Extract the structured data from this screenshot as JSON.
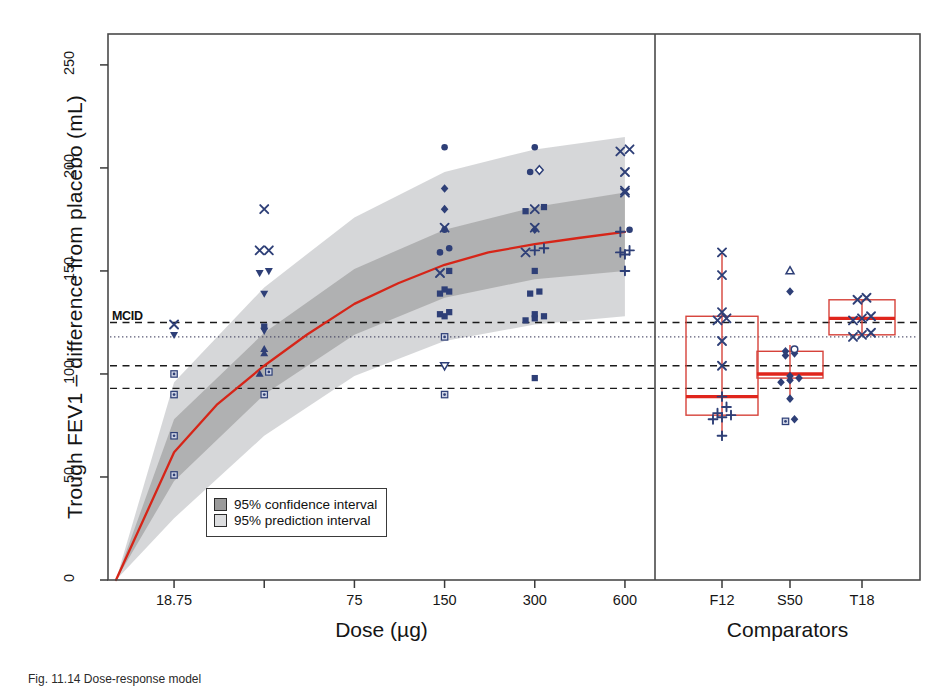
{
  "figure": {
    "domain": "chart",
    "background": "#ffffff",
    "caption_fragment": "Fig. 11.14  Dose-response model"
  },
  "chart_data": {
    "type": "scatter",
    "title": "",
    "subtitle": "",
    "xlabel": "Dose (µg)",
    "ylabel": "Trough FEV1 – difference from placebo (mL)",
    "ylim": [
      0,
      265
    ],
    "yticks": [
      0,
      50,
      100,
      150,
      200,
      250
    ],
    "ytick_labels": [
      "0",
      "50",
      "100",
      "150",
      "200",
      "250"
    ],
    "grid": false,
    "panels": [
      {
        "name": "dose-response",
        "xlabel": "Dose (µg)",
        "xscale": "log",
        "xticks": [
          18.75,
          37.5,
          75,
          150,
          300,
          600
        ],
        "xtick_labels": [
          "18.75",
          "",
          "75",
          "150",
          "300",
          "600"
        ],
        "model_curve": {
          "name": "Emax dose-response fit",
          "color": "#d62518",
          "points": [
            {
              "dose": 12.0,
              "value": 0
            },
            {
              "dose": 18.75,
              "value": 62
            },
            {
              "dose": 26.0,
              "value": 85
            },
            {
              "dose": 37.5,
              "value": 104
            },
            {
              "dose": 52.0,
              "value": 119
            },
            {
              "dose": 75.0,
              "value": 134
            },
            {
              "dose": 105.0,
              "value": 144
            },
            {
              "dose": 150.0,
              "value": 153
            },
            {
              "dose": 210.0,
              "value": 159
            },
            {
              "dose": 300.0,
              "value": 163
            },
            {
              "dose": 420.0,
              "value": 166
            },
            {
              "dose": 600.0,
              "value": 169
            }
          ]
        },
        "confidence_interval": {
          "label": "95% confidence interval",
          "color": "#9a9a9a",
          "level": 0.95,
          "lower": [
            {
              "dose": 12.0,
              "value": 0
            },
            {
              "dose": 18.75,
              "value": 48
            },
            {
              "dose": 37.5,
              "value": 90
            },
            {
              "dose": 75.0,
              "value": 119
            },
            {
              "dose": 150.0,
              "value": 137
            },
            {
              "dose": 300.0,
              "value": 146
            },
            {
              "dose": 600.0,
              "value": 150
            }
          ],
          "upper": [
            {
              "dose": 12.0,
              "value": 0
            },
            {
              "dose": 18.75,
              "value": 78
            },
            {
              "dose": 37.5,
              "value": 120
            },
            {
              "dose": 75.0,
              "value": 151
            },
            {
              "dose": 150.0,
              "value": 170
            },
            {
              "dose": 300.0,
              "value": 181
            },
            {
              "dose": 600.0,
              "value": 188
            }
          ]
        },
        "prediction_interval": {
          "label": "95% prediction interval",
          "color": "#c6c8ca",
          "level": 0.95,
          "lower": [
            {
              "dose": 12.0,
              "value": 0
            },
            {
              "dose": 18.75,
              "value": 30
            },
            {
              "dose": 37.5,
              "value": 70
            },
            {
              "dose": 75.0,
              "value": 99
            },
            {
              "dose": 150.0,
              "value": 116
            },
            {
              "dose": 300.0,
              "value": 124
            },
            {
              "dose": 600.0,
              "value": 128
            }
          ],
          "upper": [
            {
              "dose": 12.0,
              "value": 0
            },
            {
              "dose": 18.75,
              "value": 96
            },
            {
              "dose": 37.5,
              "value": 142
            },
            {
              "dose": 75.0,
              "value": 176
            },
            {
              "dose": 150.0,
              "value": 198
            },
            {
              "dose": 300.0,
              "value": 209
            },
            {
              "dose": 600.0,
              "value": 215
            }
          ]
        },
        "reference_lines": [
          {
            "name": "MCID",
            "value": 125,
            "style": "dashed",
            "label": "MCID",
            "color": "#1a1a1a"
          },
          {
            "name": "secondary-dotted",
            "value": 118,
            "style": "dotted",
            "label": "",
            "color": "#3b3b5c"
          },
          {
            "name": "mid-dashed",
            "value": 104,
            "style": "dashed",
            "label": "",
            "color": "#1a1a1a"
          },
          {
            "name": "lower-dashed",
            "value": 93,
            "style": "dashed",
            "label": "",
            "color": "#1a1a1a"
          }
        ],
        "points": [
          {
            "dose": 18.75,
            "value": 51,
            "marker": "square-dot"
          },
          {
            "dose": 18.75,
            "value": 70,
            "marker": "square-dot"
          },
          {
            "dose": 18.75,
            "value": 90,
            "marker": "square-dot"
          },
          {
            "dose": 18.75,
            "value": 100,
            "marker": "square-dot"
          },
          {
            "dose": 18.75,
            "value": 119,
            "marker": "triangle-down"
          },
          {
            "dose": 18.75,
            "value": 124,
            "marker": "x"
          },
          {
            "dose": 37.5,
            "value": 90,
            "marker": "square-dot"
          },
          {
            "dose": 37.5,
            "value": 100,
            "marker": "triangle-up"
          },
          {
            "dose": 37.5,
            "value": 101,
            "marker": "square-dot"
          },
          {
            "dose": 37.5,
            "value": 110,
            "marker": "triangle-up"
          },
          {
            "dose": 37.5,
            "value": 112,
            "marker": "triangle-up"
          },
          {
            "dose": 37.5,
            "value": 121,
            "marker": "triangle-down"
          },
          {
            "dose": 37.5,
            "value": 123,
            "marker": "square"
          },
          {
            "dose": 37.5,
            "value": 139,
            "marker": "triangle-down"
          },
          {
            "dose": 37.5,
            "value": 149,
            "marker": "triangle-down"
          },
          {
            "dose": 37.5,
            "value": 150,
            "marker": "triangle-down"
          },
          {
            "dose": 37.5,
            "value": 160,
            "marker": "x"
          },
          {
            "dose": 37.5,
            "value": 160,
            "marker": "x"
          },
          {
            "dose": 37.5,
            "value": 180,
            "marker": "x"
          },
          {
            "dose": 150,
            "value": 90,
            "marker": "square-dot"
          },
          {
            "dose": 150,
            "value": 104,
            "marker": "triangle-down-open"
          },
          {
            "dose": 150,
            "value": 118,
            "marker": "square-dot"
          },
          {
            "dose": 150,
            "value": 128,
            "marker": "square"
          },
          {
            "dose": 150,
            "value": 129,
            "marker": "square"
          },
          {
            "dose": 150,
            "value": 130,
            "marker": "square"
          },
          {
            "dose": 150,
            "value": 139,
            "marker": "square"
          },
          {
            "dose": 150,
            "value": 140,
            "marker": "square"
          },
          {
            "dose": 150,
            "value": 141,
            "marker": "square"
          },
          {
            "dose": 150,
            "value": 149,
            "marker": "x"
          },
          {
            "dose": 150,
            "value": 150,
            "marker": "square"
          },
          {
            "dose": 150,
            "value": 159,
            "marker": "circle"
          },
          {
            "dose": 150,
            "value": 161,
            "marker": "circle"
          },
          {
            "dose": 150,
            "value": 170,
            "marker": "circle"
          },
          {
            "dose": 150,
            "value": 171,
            "marker": "x"
          },
          {
            "dose": 150,
            "value": 180,
            "marker": "diamond"
          },
          {
            "dose": 150,
            "value": 190,
            "marker": "diamond"
          },
          {
            "dose": 150,
            "value": 210,
            "marker": "circle"
          },
          {
            "dose": 300,
            "value": 98,
            "marker": "square"
          },
          {
            "dose": 300,
            "value": 126,
            "marker": "square"
          },
          {
            "dose": 300,
            "value": 127,
            "marker": "square"
          },
          {
            "dose": 300,
            "value": 128,
            "marker": "square"
          },
          {
            "dose": 300,
            "value": 129,
            "marker": "square"
          },
          {
            "dose": 300,
            "value": 139,
            "marker": "square"
          },
          {
            "dose": 300,
            "value": 140,
            "marker": "square"
          },
          {
            "dose": 300,
            "value": 150,
            "marker": "square"
          },
          {
            "dose": 300,
            "value": 159,
            "marker": "x"
          },
          {
            "dose": 300,
            "value": 160,
            "marker": "plus"
          },
          {
            "dose": 300,
            "value": 161,
            "marker": "plus"
          },
          {
            "dose": 300,
            "value": 170,
            "marker": "diamond"
          },
          {
            "dose": 300,
            "value": 171,
            "marker": "x"
          },
          {
            "dose": 300,
            "value": 179,
            "marker": "square"
          },
          {
            "dose": 300,
            "value": 180,
            "marker": "x"
          },
          {
            "dose": 300,
            "value": 181,
            "marker": "square"
          },
          {
            "dose": 300,
            "value": 198,
            "marker": "circle"
          },
          {
            "dose": 300,
            "value": 199,
            "marker": "diamond-open"
          },
          {
            "dose": 300,
            "value": 210,
            "marker": "circle"
          },
          {
            "dose": 600,
            "value": 150,
            "marker": "plus"
          },
          {
            "dose": 600,
            "value": 158,
            "marker": "plus"
          },
          {
            "dose": 600,
            "value": 159,
            "marker": "plus"
          },
          {
            "dose": 600,
            "value": 160,
            "marker": "plus"
          },
          {
            "dose": 600,
            "value": 169,
            "marker": "plus"
          },
          {
            "dose": 600,
            "value": 170,
            "marker": "circle"
          },
          {
            "dose": 600,
            "value": 188,
            "marker": "x"
          },
          {
            "dose": 600,
            "value": 189,
            "marker": "x"
          },
          {
            "dose": 600,
            "value": 198,
            "marker": "x"
          },
          {
            "dose": 600,
            "value": 208,
            "marker": "x"
          },
          {
            "dose": 600,
            "value": 209,
            "marker": "x"
          }
        ]
      },
      {
        "name": "comparators",
        "xlabel": "Comparators",
        "xticks": [
          "F12",
          "S50",
          "T18"
        ],
        "boxplots": [
          {
            "label": "F12",
            "median": 89,
            "q1": 80,
            "q3": 128,
            "whisker_low": 70,
            "whisker_high": 159,
            "color": "#d6423a",
            "median_color": "#e0251c",
            "points": [
              {
                "value": 70,
                "marker": "plus"
              },
              {
                "value": 78,
                "marker": "plus"
              },
              {
                "value": 79,
                "marker": "plus"
              },
              {
                "value": 80,
                "marker": "plus"
              },
              {
                "value": 81,
                "marker": "plus"
              },
              {
                "value": 84,
                "marker": "plus"
              },
              {
                "value": 89,
                "marker": "plus"
              },
              {
                "value": 104,
                "marker": "x"
              },
              {
                "value": 116,
                "marker": "x"
              },
              {
                "value": 126,
                "marker": "x"
              },
              {
                "value": 127,
                "marker": "x"
              },
              {
                "value": 130,
                "marker": "x"
              },
              {
                "value": 148,
                "marker": "x"
              },
              {
                "value": 159,
                "marker": "x"
              }
            ]
          },
          {
            "label": "S50",
            "median": 100,
            "q1": 98,
            "q3": 111,
            "whisker_low": 88,
            "whisker_high": 114,
            "color": "#d6423a",
            "median_color": "#e0251c",
            "points": [
              {
                "value": 77,
                "marker": "square-dot"
              },
              {
                "value": 78,
                "marker": "diamond"
              },
              {
                "value": 88,
                "marker": "diamond"
              },
              {
                "value": 96,
                "marker": "diamond"
              },
              {
                "value": 97,
                "marker": "diamond"
              },
              {
                "value": 98,
                "marker": "diamond"
              },
              {
                "value": 99,
                "marker": "diamond"
              },
              {
                "value": 109,
                "marker": "diamond"
              },
              {
                "value": 110,
                "marker": "diamond"
              },
              {
                "value": 111,
                "marker": "diamond"
              },
              {
                "value": 112,
                "marker": "circle-open"
              },
              {
                "value": 140,
                "marker": "diamond"
              },
              {
                "value": 150,
                "marker": "triangle-up-open"
              }
            ]
          },
          {
            "label": "T18",
            "median": 127,
            "q1": 119,
            "q3": 136,
            "whisker_low": 119,
            "whisker_high": 136,
            "color": "#d6423a",
            "median_color": "#e0251c",
            "points": [
              {
                "value": 118,
                "marker": "x"
              },
              {
                "value": 119,
                "marker": "x"
              },
              {
                "value": 120,
                "marker": "x"
              },
              {
                "value": 126,
                "marker": "x"
              },
              {
                "value": 127,
                "marker": "x"
              },
              {
                "value": 128,
                "marker": "x"
              },
              {
                "value": 136,
                "marker": "x"
              },
              {
                "value": 137,
                "marker": "x"
              }
            ]
          }
        ]
      }
    ],
    "legend": {
      "position": "bottom-left-inside",
      "entries": [
        {
          "label": "95% confidence interval",
          "color": "#9a9a9a"
        },
        {
          "label": "95% prediction interval",
          "color": "#dcdddf"
        }
      ]
    },
    "marker_color": "#2e3f77",
    "annotations": [
      {
        "text": "MCID",
        "x": 18.0,
        "y": 125
      }
    ]
  }
}
